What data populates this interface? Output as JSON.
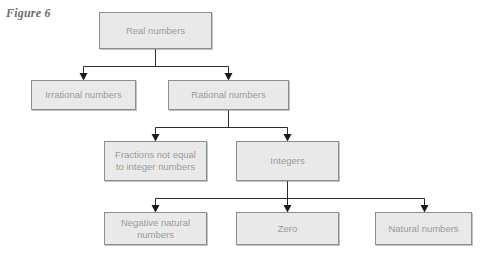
{
  "figure": {
    "label": "Figure 6"
  },
  "diagram": {
    "type": "tree",
    "title": "Figure 6",
    "nodes": [
      {
        "id": "real",
        "label": "Real numbers",
        "level": 0
      },
      {
        "id": "irrational",
        "label": "Irrational numbers",
        "level": 1
      },
      {
        "id": "rational",
        "label": "Rational numbers",
        "level": 1
      },
      {
        "id": "fractions",
        "label": "Fractions not equal to integer numbers",
        "line1": "Fractions not equal",
        "line2": "to integer numbers",
        "level": 2
      },
      {
        "id": "integers",
        "label": "Integers",
        "level": 2
      },
      {
        "id": "negative",
        "label": "Negative natural numbers",
        "line1": "Negative natural",
        "line2": "numbers",
        "level": 3
      },
      {
        "id": "zero",
        "label": "Zero",
        "level": 3
      },
      {
        "id": "natural",
        "label": "Natural numbers",
        "level": 3
      }
    ],
    "edges": [
      {
        "from": "real",
        "to": "irrational"
      },
      {
        "from": "real",
        "to": "rational"
      },
      {
        "from": "rational",
        "to": "fractions"
      },
      {
        "from": "rational",
        "to": "integers"
      },
      {
        "from": "integers",
        "to": "negative"
      },
      {
        "from": "integers",
        "to": "zero"
      },
      {
        "from": "integers",
        "to": "natural"
      }
    ],
    "colors": {
      "node_fill": "#e9e9e9",
      "node_border": "#8d8d8d",
      "node_text": "#9a9a9a",
      "connector": "#2b2b2b",
      "label_text": "#6e6e6e",
      "background": "#ffffff"
    }
  }
}
